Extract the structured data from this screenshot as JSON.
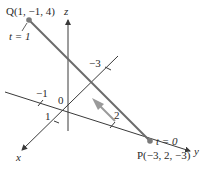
{
  "diagram": {
    "type": "3d-line-segment",
    "axes": {
      "x_label": "x",
      "y_label": "y",
      "z_label": "z",
      "origin_label": "0"
    },
    "ticks": {
      "x_pos": "1",
      "x_neg": "-3",
      "y_neg": "−1",
      "y_pos": "2",
      "x_neg_display": "−3"
    },
    "points": {
      "Q": {
        "label": "Q(1, −1, 4)",
        "param": "t = 1",
        "coords": [
          1,
          -1,
          4
        ]
      },
      "P": {
        "label": "P(−3, 2, −3)",
        "param": "t = 0",
        "coords": [
          -3,
          2,
          -3
        ]
      }
    },
    "colors": {
      "axis": "#3a3a3a",
      "segment": "#6b6b6b",
      "point": "#7a7a7a",
      "arrow": "#9a9a9a"
    }
  }
}
